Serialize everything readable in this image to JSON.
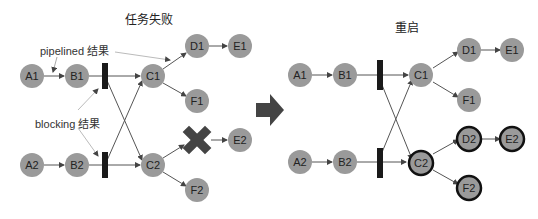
{
  "left": {
    "title": "任务失败",
    "annotations": {
      "pipelined": "pipelined 结果",
      "blocking": "blocking 结果"
    },
    "nodes": {
      "A1": "A1",
      "B1": "B1",
      "C1": "C1",
      "D1": "D1",
      "E1": "E1",
      "F1": "F1",
      "A2": "A2",
      "B2": "B2",
      "C2": "C2",
      "E2": "E2",
      "F2": "F2"
    },
    "failed_node_icon": "x-mark-icon"
  },
  "right": {
    "title": "重启",
    "nodes": {
      "A1": "A1",
      "B1": "B1",
      "C1": "C1",
      "D1": "D1",
      "E1": "E1",
      "F1": "F1",
      "A2": "A2",
      "B2": "B2",
      "C2": "C2",
      "D2": "D2",
      "E2": "E2",
      "F2": "F2"
    },
    "restarted_nodes": [
      "C2",
      "D2",
      "E2",
      "F2"
    ]
  },
  "transition_icon": "right-arrow-icon",
  "colors": {
    "node_fill": "#9a9a9a",
    "restarted_stroke": "#111111",
    "bar": "#1a1a1a",
    "arrow": "#555555",
    "failed_x": "#444444"
  }
}
